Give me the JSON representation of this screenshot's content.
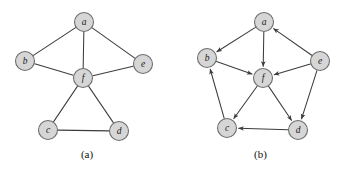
{
  "figure": {
    "background_color": "#ffffff",
    "node_fill": "#d6d6d6",
    "node_stroke": "#6e6e6e",
    "edge_color": "#3c3c3c",
    "label_color": "#1a1a1a",
    "width": 347,
    "height": 172
  },
  "panels": [
    {
      "id": "a",
      "caption": "(a)",
      "kind": "undirected",
      "nodes": [
        {
          "id": "a",
          "label": "a",
          "x": 84,
          "y": 22,
          "r": 9.5
        },
        {
          "id": "b",
          "label": "b",
          "x": 25,
          "y": 61,
          "r": 9.5
        },
        {
          "id": "e",
          "label": "e",
          "x": 143,
          "y": 64,
          "r": 9.5
        },
        {
          "id": "f",
          "label": "f",
          "x": 83,
          "y": 78,
          "r": 9.5
        },
        {
          "id": "c",
          "label": "c",
          "x": 48,
          "y": 130,
          "r": 9.5
        },
        {
          "id": "d",
          "label": "d",
          "x": 119,
          "y": 131,
          "r": 9.5
        }
      ],
      "edges": [
        {
          "from": "a",
          "to": "b",
          "directed": false
        },
        {
          "from": "a",
          "to": "e",
          "directed": false
        },
        {
          "from": "a",
          "to": "f",
          "directed": false
        },
        {
          "from": "b",
          "to": "f",
          "directed": false
        },
        {
          "from": "e",
          "to": "f",
          "directed": false
        },
        {
          "from": "f",
          "to": "c",
          "directed": false
        },
        {
          "from": "f",
          "to": "d",
          "directed": false
        },
        {
          "from": "c",
          "to": "d",
          "directed": false
        }
      ]
    },
    {
      "id": "b",
      "caption": "(b)",
      "kind": "directed",
      "nodes": [
        {
          "id": "a",
          "label": "a",
          "x": 90,
          "y": 22,
          "r": 9.5
        },
        {
          "id": "b",
          "label": "b",
          "x": 33,
          "y": 58,
          "r": 9.5
        },
        {
          "id": "e",
          "label": "e",
          "x": 146,
          "y": 61,
          "r": 9.5
        },
        {
          "id": "f",
          "label": "f",
          "x": 89,
          "y": 78,
          "r": 9.5
        },
        {
          "id": "c",
          "label": "c",
          "x": 53,
          "y": 128,
          "r": 9.5
        },
        {
          "id": "d",
          "label": "d",
          "x": 124,
          "y": 130,
          "r": 9.5
        }
      ],
      "edges": [
        {
          "from": "a",
          "to": "b",
          "directed": true
        },
        {
          "from": "a",
          "to": "f",
          "directed": true
        },
        {
          "from": "e",
          "to": "a",
          "directed": true
        },
        {
          "from": "e",
          "to": "f",
          "directed": true
        },
        {
          "from": "e",
          "to": "d",
          "directed": true
        },
        {
          "from": "b",
          "to": "f",
          "directed": true
        },
        {
          "from": "c",
          "to": "b",
          "directed": true
        },
        {
          "from": "f",
          "to": "c",
          "directed": true
        },
        {
          "from": "f",
          "to": "d",
          "directed": true
        },
        {
          "from": "d",
          "to": "c",
          "directed": true
        }
      ]
    }
  ]
}
